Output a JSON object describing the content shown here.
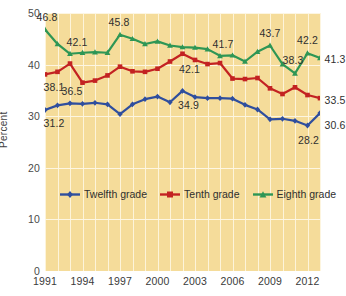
{
  "chart_data": {
    "type": "line",
    "title": "",
    "xlabel": "",
    "ylabel": "Percent",
    "ylim": [
      0,
      50
    ],
    "yticks": [
      0,
      10,
      20,
      30,
      40,
      50
    ],
    "xticks": [
      "1991",
      "1994",
      "1997",
      "2000",
      "2003",
      "2006",
      "2009",
      "2012"
    ],
    "grid": "vertical-and-horizontal",
    "legend_position": "inside-lower-left",
    "x": [
      1991,
      1992,
      1993,
      1994,
      1995,
      1996,
      1997,
      1998,
      1999,
      2000,
      2001,
      2002,
      2003,
      2004,
      2005,
      2006,
      2007,
      2008,
      2009,
      2010,
      2011,
      2012,
      2013
    ],
    "series": [
      {
        "name": "Twelfth grade",
        "color": "#2f4e9e",
        "values": [
          31.2,
          32.1,
          32.5,
          32.4,
          32.6,
          32.3,
          30.4,
          32.3,
          33.3,
          33.8,
          32.7,
          34.9,
          33.7,
          33.5,
          33.5,
          33.4,
          32.2,
          31.3,
          29.4,
          29.5,
          29.1,
          28.2,
          30.6
        ]
      },
      {
        "name": "Tenth grade",
        "color": "#c32222",
        "values": [
          38.1,
          38.6,
          40.2,
          36.5,
          36.9,
          37.9,
          39.6,
          38.7,
          38.6,
          39.2,
          40.6,
          42.1,
          40.9,
          40.1,
          40.3,
          37.3,
          37.2,
          37.4,
          35.4,
          34.3,
          35.6,
          34.1,
          33.5
        ]
      },
      {
        "name": "Eighth grade",
        "color": "#2e9655",
        "values": [
          46.8,
          44.0,
          42.1,
          42.3,
          42.4,
          42.3,
          45.8,
          45.0,
          44.0,
          44.5,
          43.7,
          43.4,
          43.3,
          43.0,
          41.7,
          41.8,
          40.6,
          42.5,
          43.7,
          40.1,
          38.3,
          42.2,
          41.3
        ]
      }
    ],
    "data_labels": [
      {
        "series": "Eighth grade",
        "x": 1991,
        "value": "46.8"
      },
      {
        "series": "Eighth grade",
        "x": 1993,
        "value": "42.1"
      },
      {
        "series": "Eighth grade",
        "x": 1997,
        "value": "45.8"
      },
      {
        "series": "Eighth grade",
        "x": 2005,
        "value": "41.7"
      },
      {
        "series": "Eighth grade",
        "x": 2009,
        "value": "43.7"
      },
      {
        "series": "Eighth grade",
        "x": 2011,
        "value": "38.3"
      },
      {
        "series": "Eighth grade",
        "x": 2012,
        "value": "42.2"
      },
      {
        "series": "Eighth grade",
        "x": 2013,
        "value": "41.3"
      },
      {
        "series": "Tenth grade",
        "x": 1991,
        "value": "38.1"
      },
      {
        "series": "Tenth grade",
        "x": 2002,
        "value": "42.1"
      },
      {
        "series": "Tenth grade",
        "x": 2013,
        "value": "33.5"
      },
      {
        "series": "Twelfth grade",
        "x": 1991,
        "value": "31.2"
      },
      {
        "series": "Twelfth grade",
        "x": 1993,
        "value": "36.5"
      },
      {
        "series": "Twelfth grade",
        "x": 2002,
        "value": "34.9"
      },
      {
        "series": "Twelfth grade",
        "x": 2012,
        "value": "28.2"
      },
      {
        "series": "Twelfth grade",
        "x": 2013,
        "value": "30.6"
      }
    ]
  },
  "axes": {
    "y_title": "Percent",
    "y_ticks": [
      "50",
      "40",
      "30",
      "20",
      "10",
      "0"
    ],
    "x_ticks": [
      "1991",
      "1994",
      "1997",
      "2000",
      "2003",
      "2006",
      "2009",
      "2012"
    ]
  },
  "legend": {
    "items": [
      {
        "label": "Twelfth grade",
        "color": "#2f4e9e"
      },
      {
        "label": "Tenth grade",
        "color": "#c32222"
      },
      {
        "label": "Eighth grade",
        "color": "#2e9655"
      }
    ]
  },
  "labels": {
    "e1991": "46.8",
    "e1993": "42.1",
    "e1997": "45.8",
    "e2005": "41.7",
    "e2009": "43.7",
    "e2011": "38.3",
    "e2012": "42.2",
    "e2013": "41.3",
    "t1991": "38.1",
    "t2002": "42.1",
    "t2013": "33.5",
    "w1991": "31.2",
    "w1993": "36.5",
    "w2002": "34.9",
    "w2012": "28.2",
    "w2013": "30.6"
  },
  "colors": {
    "plot_background": "#f5dc9a",
    "gridline": "#fdf4dd",
    "twelfth": "#2f4e9e",
    "tenth": "#c32222",
    "eighth": "#2e9655"
  }
}
